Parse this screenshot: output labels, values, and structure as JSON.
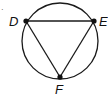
{
  "figure": {
    "type": "inscribed-triangle",
    "circle": {
      "cx": 60,
      "cy": 41,
      "r": 38
    },
    "points": {
      "D": {
        "label": "D",
        "x": 26,
        "y": 21
      },
      "E": {
        "label": "E",
        "x": 94,
        "y": 21
      },
      "F": {
        "label": "F",
        "x": 60,
        "y": 77
      }
    },
    "segments": [
      "DE",
      "EF",
      "FD"
    ],
    "stray_mark": "·"
  },
  "colors": {
    "stroke": "#1a1a1a",
    "background": "#ffffff"
  }
}
